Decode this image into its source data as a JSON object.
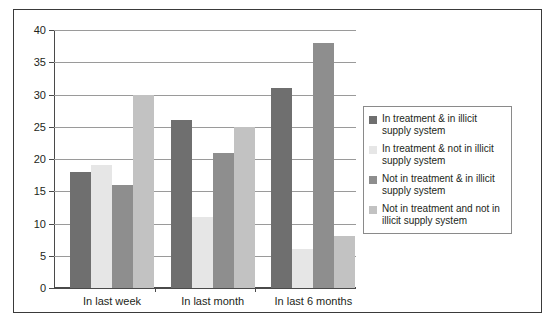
{
  "chart_data": {
    "type": "bar",
    "title": "",
    "xlabel": "",
    "ylabel": "",
    "ylim": [
      0,
      40
    ],
    "yticks": [
      0,
      5,
      10,
      15,
      20,
      25,
      30,
      35,
      40
    ],
    "ytick_labels": [
      "0",
      "5",
      "10",
      "15",
      "20",
      "25",
      "30",
      "35",
      "40"
    ],
    "grid": true,
    "legend_position": "right",
    "categories": [
      "In last week",
      "In last month",
      "In last 6 months"
    ],
    "series": [
      {
        "name": "In treatment & in illicit supply system",
        "color": "#6f6f6f",
        "values": [
          18,
          26,
          31
        ]
      },
      {
        "name": "In treatment & not in illicit supply system",
        "color": "#e6e6e6",
        "values": [
          19,
          11,
          6
        ]
      },
      {
        "name": "Not in treatment & in illicit supply system",
        "color": "#8e8e8e",
        "values": [
          16,
          21,
          38
        ]
      },
      {
        "name": "Not in treatment and not in illicit supply system",
        "color": "#c2c2c2",
        "values": [
          30,
          25,
          8
        ]
      }
    ]
  },
  "legend": {
    "items": [
      {
        "label": "In treatment & in illicit supply system",
        "color": "#6f6f6f"
      },
      {
        "label": "In treatment & not in illicit supply system",
        "color": "#e6e6e6"
      },
      {
        "label": "Not in treatment & in illicit supply system",
        "color": "#8e8e8e"
      },
      {
        "label": "Not in treatment and not in illicit supply system",
        "color": "#c2c2c2"
      }
    ]
  },
  "colors": {
    "frame_border": "#3a3a3a",
    "axis": "#4a4a4a",
    "gridline": "#9a9a9a",
    "text": "#231f20",
    "background": "#ffffff"
  }
}
